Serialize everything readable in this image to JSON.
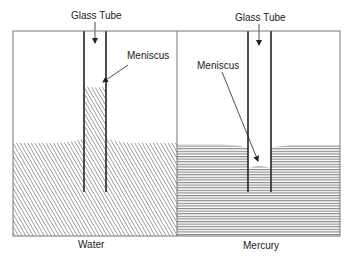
{
  "diagram": {
    "panels": [
      {
        "id": "water",
        "label": "Water",
        "tube_label": "Glass Tube",
        "meniscus_label": "Meniscus",
        "liquid_behavior": "rises in tube (concave meniscus)",
        "fill_pattern": "diagonal-hatch"
      },
      {
        "id": "mercury",
        "label": "Mercury",
        "tube_label": "Glass Tube",
        "meniscus_label": "Meniscus",
        "liquid_behavior": "depressed in tube (convex meniscus)",
        "fill_pattern": "horizontal-lines"
      }
    ],
    "colors": {
      "line": "#333333",
      "frame": "#777777",
      "hatch": "#666666",
      "background": "#ffffff"
    }
  }
}
